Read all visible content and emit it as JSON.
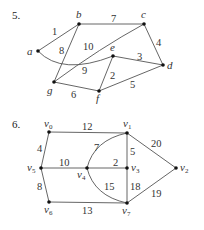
{
  "graphs": [
    {
      "number": "5.",
      "nodes": [
        {
          "id": "a",
          "label": "a",
          "x": 38,
          "y": 51
        },
        {
          "id": "b",
          "label": "b",
          "x": 79,
          "y": 24
        },
        {
          "id": "c",
          "label": "c",
          "x": 144,
          "y": 24
        },
        {
          "id": "d",
          "label": "d",
          "x": 163,
          "y": 65
        },
        {
          "id": "e",
          "label": "e",
          "x": 113,
          "y": 56
        },
        {
          "id": "f",
          "label": "f",
          "x": 99,
          "y": 91
        },
        {
          "id": "g",
          "label": "g",
          "x": 54,
          "y": 82
        }
      ],
      "edges": [
        {
          "from": "a",
          "to": "b",
          "weight": "1"
        },
        {
          "from": "b",
          "to": "c",
          "weight": "7"
        },
        {
          "from": "c",
          "to": "d",
          "weight": "4"
        },
        {
          "from": "e",
          "to": "d",
          "weight": "3"
        },
        {
          "from": "b",
          "to": "g",
          "weight": "8"
        },
        {
          "from": "g",
          "to": "c",
          "weight": "10"
        },
        {
          "from": "a",
          "to": "e",
          "weight": "9",
          "curved": true
        },
        {
          "from": "e",
          "to": "f",
          "weight": "2"
        },
        {
          "from": "g",
          "to": "f",
          "weight": "6"
        },
        {
          "from": "f",
          "to": "d",
          "weight": "5"
        }
      ]
    },
    {
      "number": "6.",
      "nodes": [
        {
          "id": "v0",
          "label": "v",
          "sub": "0",
          "x": 49,
          "y": 132
        },
        {
          "id": "v1",
          "label": "v",
          "sub": "1",
          "x": 127,
          "y": 133
        },
        {
          "id": "v2",
          "label": "v",
          "sub": "2",
          "x": 176,
          "y": 168
        },
        {
          "id": "v3",
          "label": "v",
          "sub": "3",
          "x": 127,
          "y": 168
        },
        {
          "id": "v4",
          "label": "v",
          "sub": "4",
          "x": 87,
          "y": 168
        },
        {
          "id": "v5",
          "label": "v",
          "sub": "5",
          "x": 41,
          "y": 168
        },
        {
          "id": "v6",
          "label": "v",
          "sub": "6",
          "x": 49,
          "y": 202
        },
        {
          "id": "v7",
          "label": "v",
          "sub": "7",
          "x": 127,
          "y": 203
        }
      ],
      "edges": [
        {
          "from": "v0",
          "to": "v1",
          "weight": "12"
        },
        {
          "from": "v1",
          "to": "v2",
          "weight": "20"
        },
        {
          "from": "v0",
          "to": "v5",
          "weight": "4"
        },
        {
          "from": "v4",
          "to": "v1",
          "weight": "7",
          "curved": true
        },
        {
          "from": "v1",
          "to": "v3",
          "weight": "5"
        },
        {
          "from": "v5",
          "to": "v4",
          "weight": "10"
        },
        {
          "from": "v4",
          "to": "v3",
          "weight": "2"
        },
        {
          "from": "v5",
          "to": "v6",
          "weight": "8"
        },
        {
          "from": "v4",
          "to": "v7",
          "weight": "15",
          "curved": true
        },
        {
          "from": "v3",
          "to": "v7",
          "weight": "18"
        },
        {
          "from": "v7",
          "to": "v2",
          "weight": "19"
        },
        {
          "from": "v6",
          "to": "v7",
          "weight": "13"
        }
      ]
    }
  ]
}
